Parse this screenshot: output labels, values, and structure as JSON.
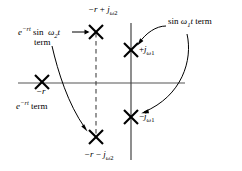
{
  "figure": {
    "type": "s-plane pole-zero diagram",
    "background_color": "#ffffff",
    "stroke_color": "#000000",
    "axis_color": "#555555",
    "axes": {
      "real_axis": {
        "label": "",
        "x_from": 18,
        "x_to": 185,
        "y": 83
      },
      "imag_axis": {
        "label": "",
        "x": 131,
        "y_from": 23,
        "y_to": 160
      },
      "dashed_line": {
        "x": 96,
        "y_from": 33,
        "y_to": 137
      }
    },
    "poles": [
      {
        "id": "pole-neg-r-plus-jw2",
        "x": 96,
        "y": 32,
        "label": "−r + jω₂"
      },
      {
        "id": "pole-neg-r-minus-jw2",
        "x": 96,
        "y": 137,
        "label": "−r − jω₂"
      },
      {
        "id": "pole-neg-r",
        "x": 42,
        "y": 82,
        "label": "−r"
      },
      {
        "id": "pole-plus-jw1",
        "x": 131,
        "y": 50,
        "label": "+jω₁"
      },
      {
        "id": "pole-minus-jw1",
        "x": 131,
        "y": 117,
        "label": "−jω₁"
      }
    ]
  },
  "labels": {
    "top_pole": {
      "base": "−r + j",
      "sub_var": "ω",
      "sub_idx": "2"
    },
    "bottom_pole": {
      "base": "−r − j",
      "sub_var": "ω",
      "sub_idx": "2"
    },
    "real_pole": "−r",
    "plus_jw1": {
      "sign": "+j",
      "var": "ω",
      "idx": "1"
    },
    "minus_jw1": {
      "sign": "−j",
      "var": "ω",
      "idx": "1"
    },
    "exp_sin_term_line1": "e⁻ʳᵗ sin ω₂t",
    "exp_sin_term_line2": "term",
    "exp_term": "e⁻ʳᵗ term",
    "sin_w1_term": "sin ω₁t term"
  },
  "annotations": [
    {
      "name": "arrow-exp-sin-to-top-pole",
      "kind": "straight-arrow",
      "from": [
        74,
        32
      ],
      "to": [
        89,
        32
      ]
    },
    {
      "name": "arrow-exp-sin-to-bottom-pole",
      "kind": "curved-arrow",
      "from": [
        52,
        47
      ],
      "to": [
        88,
        131
      ]
    },
    {
      "name": "arrow-sin-w1-to-upper-pole",
      "kind": "curved-arrow",
      "from": [
        162,
        28
      ],
      "to": [
        137,
        44
      ]
    },
    {
      "name": "arrow-sin-w1-to-lower-pole",
      "kind": "curved-arrow",
      "from": [
        186,
        33
      ],
      "to": [
        140,
        113
      ]
    }
  ]
}
